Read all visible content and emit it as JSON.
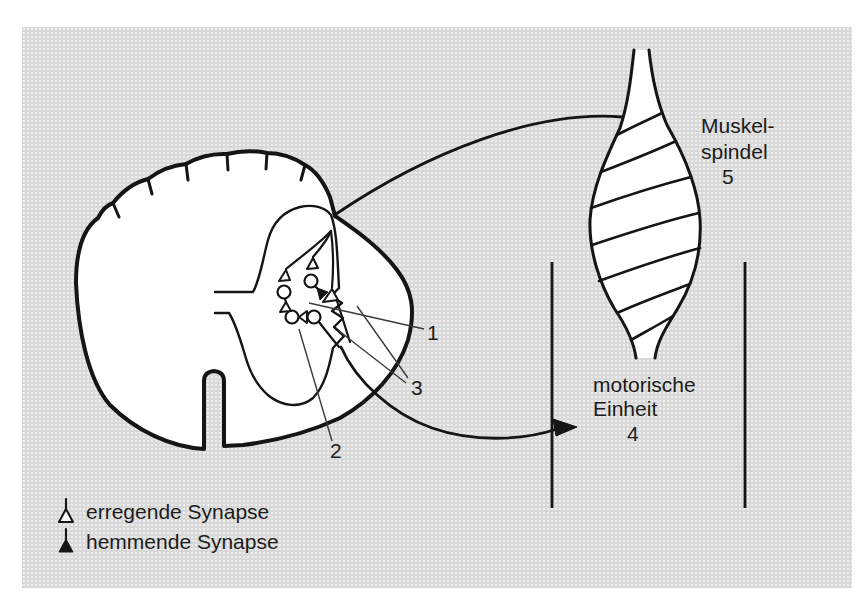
{
  "labels": {
    "spindle": {
      "line1": "Muskel-",
      "line2": "spindel",
      "number": "5"
    },
    "motor_unit": {
      "line1": "motorische",
      "line2": "Einheit",
      "number": "4"
    },
    "pointers": {
      "p1": "1",
      "p2": "2",
      "p3": "3"
    }
  },
  "legend": {
    "excitatory_label": "erregende Synapse",
    "inhibitory_label": "hemmende Synapse"
  },
  "colors": {
    "panel_background": "#d9d9d9",
    "line": "#151515",
    "fill": "#ffffff",
    "text": "#1c1c1c",
    "leader": "#3a3a3a"
  }
}
